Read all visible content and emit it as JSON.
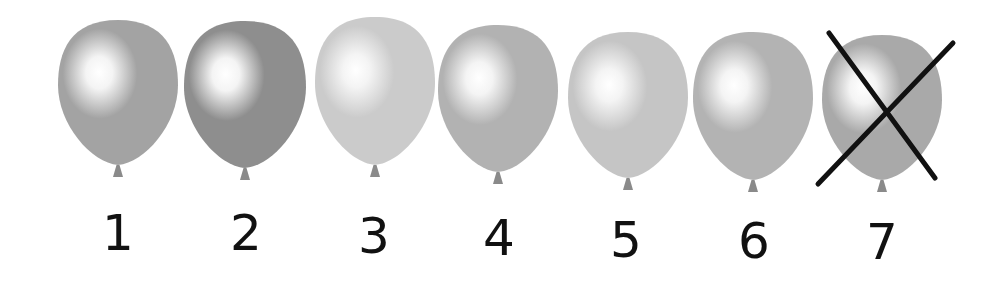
{
  "balloons": [
    {
      "label": "1",
      "cx": 118,
      "top": 20,
      "width": 120,
      "height": 145,
      "color": "#a3a3a3",
      "crossed": false,
      "label_top": 208
    },
    {
      "label": "2",
      "cx": 245,
      "top": 21,
      "width": 122,
      "height": 147,
      "color": "#8e8e8e",
      "crossed": false,
      "label_top": 208
    },
    {
      "label": "3",
      "cx": 375,
      "top": 17,
      "width": 120,
      "height": 148,
      "color": "#cbcbcb",
      "crossed": false,
      "label_top": 211
    },
    {
      "label": "4",
      "cx": 498,
      "top": 25,
      "width": 120,
      "height": 147,
      "color": "#b2b2b2",
      "crossed": false,
      "label_top": 213
    },
    {
      "label": "5",
      "cx": 628,
      "top": 32,
      "width": 120,
      "height": 146,
      "color": "#c5c5c5",
      "crossed": false,
      "label_top": 215
    },
    {
      "label": "6",
      "cx": 753,
      "top": 32,
      "width": 120,
      "height": 148,
      "color": "#b3b3b3",
      "crossed": false,
      "label_top": 216
    },
    {
      "label": "7",
      "cx": 882,
      "top": 35,
      "width": 120,
      "height": 145,
      "color": "#a9a9a9",
      "crossed": true,
      "label_top": 217
    }
  ],
  "cross_mark": {
    "line1": {
      "x1": 829,
      "y1": 33,
      "x2": 935,
      "y2": 178
    },
    "line2": {
      "x1": 818,
      "y1": 184,
      "x2": 953,
      "y2": 43
    },
    "color": "#111111"
  },
  "colors": {
    "background": "#ffffff",
    "knot": "#8a8a8a",
    "highlight": "#ffffff",
    "number_text": "#111111"
  }
}
